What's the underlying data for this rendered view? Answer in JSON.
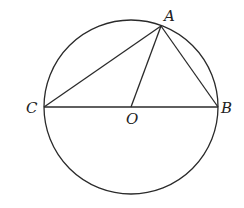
{
  "diagram": {
    "type": "geometry",
    "colors": {
      "stroke": "#2a2a2a",
      "label": "#222222",
      "background": "#ffffff"
    },
    "circle": {
      "center": "O",
      "cx": 131,
      "cy": 107,
      "r": 87
    },
    "points": {
      "A": {
        "label": "A",
        "x": 161,
        "y": 26
      },
      "B": {
        "label": "B",
        "x": 218,
        "y": 107
      },
      "C": {
        "label": "C",
        "x": 44,
        "y": 107
      },
      "O": {
        "label": "O",
        "x": 131,
        "y": 107
      }
    },
    "segments": [
      {
        "from": "C",
        "to": "B"
      },
      {
        "from": "C",
        "to": "A"
      },
      {
        "from": "A",
        "to": "B"
      },
      {
        "from": "A",
        "to": "O"
      }
    ],
    "labels": {
      "A": "A",
      "B": "B",
      "C": "C",
      "O": "O"
    }
  }
}
